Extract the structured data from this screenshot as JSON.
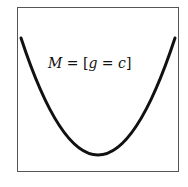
{
  "diagram": {
    "type": "parabola",
    "label": {
      "lhs": "M",
      "eq1": " = [",
      "var1": "g",
      "eq2": " = ",
      "var2": "c",
      "close": "]"
    },
    "colors": {
      "curve": "#111111",
      "frame": "#555555",
      "background": "#ffffff"
    }
  }
}
